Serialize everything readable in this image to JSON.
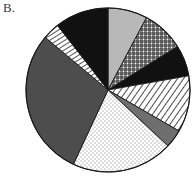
{
  "figure": {
    "panel_label": "B.",
    "background_color": "#ffffff",
    "outline_color": "#1a1a1a"
  },
  "chart_data": {
    "type": "pie",
    "title": "B.",
    "xlabel": "",
    "ylabel": "",
    "legend_position": "none",
    "grid": false,
    "center_x": 108,
    "center_y": 90,
    "radius": 82,
    "start_angle_deg": 0,
    "direction": "clockwise",
    "categories": [
      "Segment 1",
      "Segment 2",
      "Segment 3",
      "Segment 4",
      "Segment 5",
      "Segment 6",
      "Segment 7",
      "Segment 8",
      "Segment 9"
    ],
    "values": [
      28,
      30,
      22,
      40,
      13,
      72,
      105,
      12,
      58
    ],
    "values_unit": "degrees",
    "percentages": [
      7.8,
      8.3,
      6.1,
      11.1,
      3.6,
      20.0,
      29.2,
      3.3,
      16.1
    ],
    "slices": [
      {
        "name": "Segment 1",
        "fill_style": "solid-light-gray",
        "color": "#b8b8b8",
        "start_deg": 0,
        "end_deg": 28,
        "sweep_deg": 28,
        "percent": 7.8
      },
      {
        "name": "Segment 2",
        "fill_style": "crosshatch-grid",
        "color": "#ffffff",
        "pattern_color": "#2b2b2b",
        "start_deg": 28,
        "end_deg": 58,
        "sweep_deg": 30,
        "percent": 8.3
      },
      {
        "name": "Segment 3",
        "fill_style": "solid-black",
        "color": "#111111",
        "start_deg": 58,
        "end_deg": 80,
        "sweep_deg": 22,
        "percent": 6.1
      },
      {
        "name": "Segment 4",
        "fill_style": "diagonal-hatch",
        "color": "#ffffff",
        "pattern_color": "#2b2b2b",
        "start_deg": 80,
        "end_deg": 120,
        "sweep_deg": 40,
        "percent": 11.1
      },
      {
        "name": "Segment 5",
        "fill_style": "solid-medium-gray",
        "color": "#6e6e6e",
        "start_deg": 120,
        "end_deg": 133,
        "sweep_deg": 13,
        "percent": 3.6
      },
      {
        "name": "Segment 6",
        "fill_style": "stipple-dots",
        "color": "#ffffff",
        "pattern_color": "#555555",
        "start_deg": 133,
        "end_deg": 205,
        "sweep_deg": 72,
        "percent": 20.0
      },
      {
        "name": "Segment 7",
        "fill_style": "solid-dark-gray",
        "color": "#4d4d4d",
        "start_deg": 205,
        "end_deg": 310,
        "sweep_deg": 105,
        "percent": 29.2
      },
      {
        "name": "Segment 8",
        "fill_style": "narrow-diagonal-stripe",
        "color": "#ffffff",
        "pattern_color": "#2b2b2b",
        "start_deg": 310,
        "end_deg": 322,
        "sweep_deg": 12,
        "percent": 3.3
      },
      {
        "name": "Segment 9",
        "fill_style": "solid-black",
        "color": "#111111",
        "start_deg": 322,
        "end_deg": 360,
        "sweep_deg": 38,
        "percent": 16.1
      }
    ]
  }
}
